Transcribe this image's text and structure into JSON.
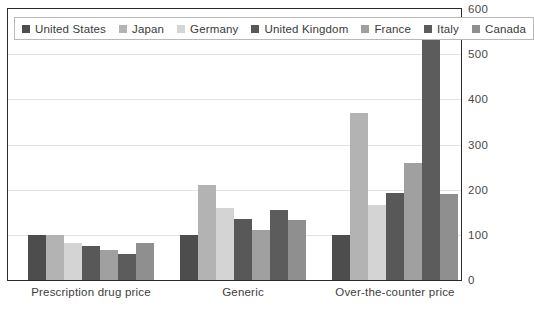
{
  "chart_data": {
    "type": "bar",
    "title": "",
    "subtitle": "",
    "xlabel": "",
    "ylabel": "",
    "ylim": [
      0,
      600
    ],
    "yticks": [
      0,
      100,
      200,
      300,
      400,
      500,
      600
    ],
    "ytick_labels": [
      "0",
      "100",
      "200",
      "300",
      "400",
      "500",
      "600"
    ],
    "grid": true,
    "legend_position": "top-left",
    "categories": [
      "Prescription drug price",
      "Generic",
      "Over-the-counter price"
    ],
    "series": [
      {
        "name": "United States",
        "color": "#4d4d4d",
        "values": [
          100,
          100,
          100
        ]
      },
      {
        "name": "Japan",
        "color": "#b3b3b3",
        "values": [
          100,
          210,
          370
        ]
      },
      {
        "name": "Germany",
        "color": "#d4d4d4",
        "values": [
          82,
          160,
          165
        ]
      },
      {
        "name": "United Kingdom",
        "color": "#585858",
        "values": [
          76,
          135,
          192
        ]
      },
      {
        "name": "France",
        "color": "#a0a0a0",
        "values": [
          66,
          110,
          258
        ]
      },
      {
        "name": "Italy",
        "color": "#5c5c5c",
        "values": [
          58,
          155,
          545
        ]
      },
      {
        "name": "Canada",
        "color": "#8f8f8f",
        "values": [
          83,
          132,
          190
        ]
      }
    ]
  },
  "legend": {
    "items": [
      {
        "label": "United States"
      },
      {
        "label": "Japan"
      },
      {
        "label": "Germany"
      },
      {
        "label": "United Kingdom"
      },
      {
        "label": "France"
      },
      {
        "label": "Italy"
      },
      {
        "label": "Canada"
      }
    ]
  }
}
